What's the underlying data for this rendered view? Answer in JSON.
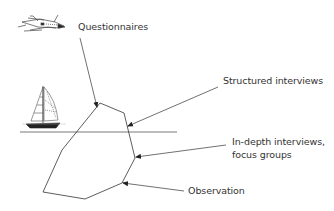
{
  "diagram": {
    "type": "iceberg",
    "labels": {
      "questionnaires": "Questionnaires",
      "structured_interviews": "Structured interviews",
      "in_depth_line1": "In-depth interviews,",
      "in_depth_line2": "focus groups",
      "observation": "Observation"
    },
    "icons": [
      "airplane-icon",
      "sailboat-icon"
    ],
    "colors": {
      "line": "#333333",
      "text": "#333333",
      "background": "#ffffff"
    }
  }
}
